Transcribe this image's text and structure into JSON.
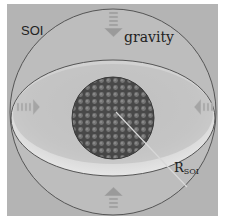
{
  "diagram": {
    "labels": {
      "soi": "SOI",
      "gravity": "gravity",
      "radius_main": "R",
      "radius_sub": "SOI"
    },
    "elements": {
      "outer_sphere": "sphere-of-influence boundary",
      "equatorial_ellipse": "equatorial plane",
      "core": "cluster of particles",
      "arrows": [
        "top",
        "left",
        "right",
        "bottom"
      ],
      "radius_line": "from core center to SOI boundary"
    },
    "colors": {
      "background": "#b4b4b4",
      "band_light": "#d6d6d6",
      "core_dark": "#4a4a4a",
      "particle": "#7a7a7a",
      "outline": "#555555"
    }
  }
}
